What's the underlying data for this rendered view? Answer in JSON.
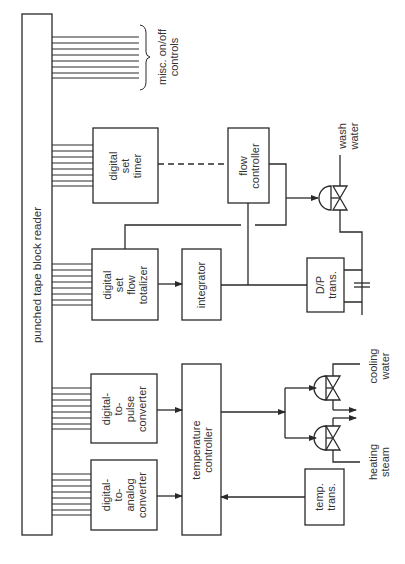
{
  "diagram": {
    "orientation": "rotated-90-ccw",
    "colors": {
      "line": "#2a2a2a",
      "background": "#ffffff"
    },
    "blocks": {
      "tape_reader": {
        "label": "punched tape block reader"
      },
      "timer": {
        "lines": [
          "digital",
          "set",
          "timer"
        ]
      },
      "totalizer": {
        "lines": [
          "digital",
          "set",
          "flow",
          "totalizer"
        ]
      },
      "pulse_converter": {
        "lines": [
          "digital-",
          "to-",
          "pulse",
          "converter"
        ]
      },
      "analog_converter": {
        "lines": [
          "digital-",
          "to-",
          "analog",
          "converter"
        ]
      },
      "flow_controller": {
        "lines": [
          "flow",
          "controller"
        ]
      },
      "integrator": {
        "lines": [
          "integrator"
        ]
      },
      "temperature_controller": {
        "lines": [
          "temperature",
          "controller"
        ]
      },
      "dp_trans": {
        "lines": [
          "D/P",
          "trans."
        ]
      },
      "temp_trans": {
        "lines": [
          "temp.",
          "trans."
        ]
      }
    },
    "labels": {
      "misc": [
        "misc. on/off",
        "controls"
      ],
      "wash_water": [
        "wash",
        "water"
      ],
      "cooling_water": [
        "cooling",
        "water"
      ],
      "heating_steam": [
        "heating",
        "steam"
      ]
    },
    "connections": [
      {
        "from": "tape_reader",
        "to": "misc",
        "type": "bus"
      },
      {
        "from": "tape_reader",
        "to": "timer",
        "type": "bus"
      },
      {
        "from": "tape_reader",
        "to": "totalizer",
        "type": "bus"
      },
      {
        "from": "tape_reader",
        "to": "pulse_converter",
        "type": "bus"
      },
      {
        "from": "tape_reader",
        "to": "analog_converter",
        "type": "bus"
      },
      {
        "from": "timer",
        "to": "flow_controller",
        "type": "dashed"
      },
      {
        "from": "totalizer",
        "to": "integrator",
        "type": "arrow"
      },
      {
        "from": "dp_trans",
        "to": "integrator",
        "type": "signal"
      },
      {
        "from": "dp_trans",
        "to": "flow_controller",
        "type": "signal"
      },
      {
        "from": "flow_controller",
        "to": "wash_water_valve",
        "type": "arrow"
      },
      {
        "from": "flow_controller",
        "to": "totalizer",
        "type": "signal"
      },
      {
        "from": "pulse_converter",
        "to": "temperature_controller",
        "type": "arrow"
      },
      {
        "from": "analog_converter",
        "to": "temperature_controller",
        "type": "arrow"
      },
      {
        "from": "temp_trans",
        "to": "temperature_controller",
        "type": "arrow"
      },
      {
        "from": "temperature_controller",
        "to": "cooling_water_valve",
        "type": "arrow"
      },
      {
        "from": "temperature_controller",
        "to": "heating_steam_valve",
        "type": "arrow"
      }
    ]
  }
}
